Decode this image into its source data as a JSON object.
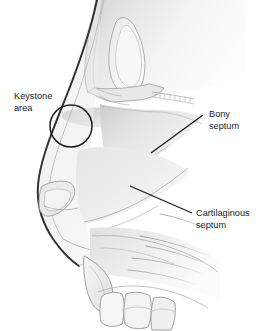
{
  "figure": {
    "name": "nasal-septum-lateral-illustration",
    "background_color": "#ffffff",
    "width": 273,
    "height": 331
  },
  "palette": {
    "background": "#ffffff",
    "outline_dark": "#2b2b2b",
    "outline_mid": "#8d8d8d",
    "outline_light": "#b4b4b4",
    "fill_pale": "#eeeeee",
    "fill_light": "#e4e4e4",
    "fill_mid": "#d6d6d6",
    "fill_shadow": "#c6c6c6",
    "text_color": "#1d1d1d",
    "leader_color": "#1d1d1d"
  },
  "annotations": [
    {
      "id": "keystone-area",
      "label_line1": "Keystone",
      "label_line2": "area",
      "marker": "circle",
      "text_x": 14,
      "text_y": 99,
      "circle_cx": 71,
      "circle_cy": 126,
      "circle_r": 21
    },
    {
      "id": "bony-septum",
      "label_line1": "Bony",
      "label_line2": "septum",
      "marker": "leader-line",
      "text_x": 209,
      "text_y": 117,
      "leader_x1": 151,
      "leader_y1": 153,
      "leader_x2": 203,
      "leader_y2": 115
    },
    {
      "id": "cartilaginous-septum",
      "label_line1": "Cartilaginous",
      "label_line2": "septum",
      "marker": "leader-line",
      "text_x": 196,
      "text_y": 216,
      "leader_x1": 130,
      "leader_y1": 186,
      "leader_x2": 192,
      "leader_y2": 213
    }
  ],
  "structures": [
    {
      "id": "forehead-glabella",
      "label": "forehead and glabella"
    },
    {
      "id": "frontal-sinus",
      "label": "frontal sinus"
    },
    {
      "id": "nasal-bone",
      "label": "nasal bone"
    },
    {
      "id": "nasal-dorsum",
      "label": "nasal dorsum soft tissue"
    },
    {
      "id": "nasal-tip",
      "label": "nasal tip"
    },
    {
      "id": "alar-cartilage",
      "label": "lower lateral alar cartilage"
    },
    {
      "id": "bony-septum-region",
      "label": "bony septum (perpendicular plate and vomer)"
    },
    {
      "id": "cartilaginous-septum-region",
      "label": "quadrangular cartilage"
    },
    {
      "id": "cribriform-plate",
      "label": "cribriform plate serrated margin"
    },
    {
      "id": "turbinate-lines",
      "label": "turbinate and palate contour lines"
    },
    {
      "id": "anterior-nasal-spine",
      "label": "anterior nasal spine"
    },
    {
      "id": "incisor-teeth",
      "label": "upper incisor teeth"
    },
    {
      "id": "hard-palate",
      "label": "hard palate"
    }
  ]
}
